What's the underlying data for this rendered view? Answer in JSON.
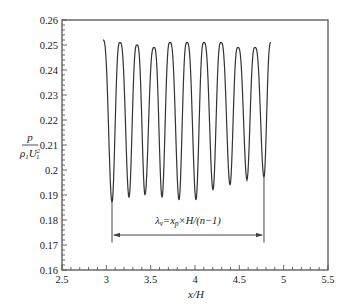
{
  "chart_data": {
    "type": "line",
    "title": "",
    "xlabel": "x/H",
    "ylabel": "p / (ρ1 U1²)",
    "xlim": [
      2.5,
      5.5
    ],
    "ylim": [
      0.16,
      0.26
    ],
    "grid": false,
    "legend": null,
    "x_ticks": [
      "2.5",
      "3",
      "3.5",
      "4",
      "4.5",
      "5",
      "5.5"
    ],
    "y_ticks": [
      "0.16",
      "0.17",
      "0.18",
      "0.19",
      "0.2",
      "0.21",
      "0.22",
      "0.23",
      "0.24",
      "0.25",
      "0.26"
    ],
    "series": [
      {
        "name": "pressure",
        "color": "#333333",
        "x": [
          2.962,
          3.064,
          3.154,
          3.256,
          3.346,
          3.436,
          3.538,
          3.628,
          3.718,
          3.82,
          3.91,
          4.011,
          4.101,
          4.203,
          4.293,
          4.395,
          4.485,
          4.586,
          4.677,
          4.778,
          4.857
        ],
        "y": [
          0.252,
          0.187,
          0.251,
          0.189,
          0.25,
          0.19,
          0.249,
          0.189,
          0.251,
          0.188,
          0.251,
          0.188,
          0.251,
          0.192,
          0.251,
          0.194,
          0.249,
          0.196,
          0.249,
          0.197,
          0.251
        ]
      }
    ],
    "annotations": [
      {
        "type": "dimension-arrow",
        "text_parts": {
          "lambda": "λ",
          "lambda_sub": "v",
          "eq": "=x",
          "xp_sub": "p",
          "rest": "×H/(n−1)"
        },
        "x_start": 3.064,
        "x_end": 4.778,
        "y": 0.174,
        "text_y": 0.1785,
        "vline_bottom": 0.171
      }
    ]
  }
}
